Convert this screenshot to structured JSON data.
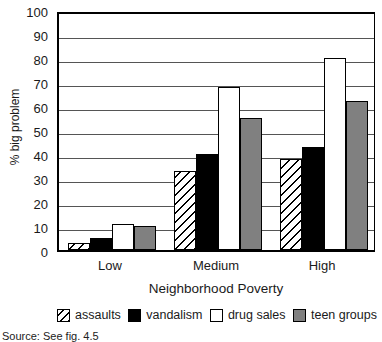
{
  "chart_data": {
    "type": "bar",
    "title": "",
    "xlabel": "Neighborhood Poverty",
    "ylabel": "% big problem",
    "ylim": [
      0,
      100
    ],
    "ytick_values": [
      0,
      10,
      20,
      30,
      40,
      50,
      60,
      70,
      80,
      90,
      100
    ],
    "ytick_labels": [
      "0",
      "10",
      "20",
      "30",
      "40",
      "50",
      "60",
      "70",
      "80",
      "90",
      "100"
    ],
    "grid": true,
    "legend_position": "bottom",
    "categories": [
      "Low",
      "Medium",
      "High"
    ],
    "series": [
      {
        "name": "assaults",
        "values": [
          3,
          33,
          38
        ],
        "color": "#ffffff",
        "pattern": "diagonal-hatch"
      },
      {
        "name": "vandalism",
        "values": [
          5,
          40,
          43
        ],
        "color": "#000000",
        "pattern": "solid"
      },
      {
        "name": "drug sales",
        "values": [
          11,
          68,
          80
        ],
        "color": "#ffffff",
        "pattern": "solid"
      },
      {
        "name": "teen groups",
        "values": [
          10,
          55,
          62
        ],
        "color": "#808080",
        "pattern": "solid"
      }
    ],
    "source_note": "Source: See fig. 4.5"
  },
  "axes": {
    "ylabel": "% big problem",
    "xtitle": "Neighborhood Poverty",
    "yticks": [
      "100",
      "90",
      "80",
      "70",
      "60",
      "50",
      "40",
      "30",
      "20",
      "10",
      "0"
    ],
    "xticks": [
      "Low",
      "Medium",
      "High"
    ]
  },
  "legend": {
    "items": [
      {
        "label": "assaults"
      },
      {
        "label": "vandalism"
      },
      {
        "label": "drug sales"
      },
      {
        "label": "teen groups"
      }
    ]
  },
  "footer": {
    "source": "Source: See fig. 4.5"
  }
}
